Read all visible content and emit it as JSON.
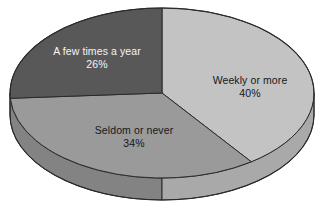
{
  "chart_data": {
    "type": "pie",
    "title": "",
    "subtitle": "",
    "xlabel": "",
    "ylabel": "",
    "legend_position": "none",
    "grid": false,
    "style": "3d-pie",
    "start_angle_deg": 0,
    "direction": "clockwise",
    "labels_inside": true,
    "background_color": "#ffffff",
    "categories": [
      "Weekly or more",
      "Seldom or never",
      "A few times a year"
    ],
    "values": [
      40,
      34,
      26
    ],
    "value_unit": "%",
    "slices": [
      {
        "label": "Weekly or more",
        "value": 40,
        "value_text": "40%",
        "color": "#c3c3c3",
        "side_color": "#a9a9a9",
        "text_color": "#16181a"
      },
      {
        "label": "Seldom or never",
        "value": 34,
        "value_text": "34%",
        "color": "#9a9a9a",
        "side_color": "#838383",
        "text_color": "#16181a"
      },
      {
        "label": "A few times a year",
        "value": 26,
        "value_text": "26%",
        "color": "#585858",
        "side_color": "#4a4a4a",
        "text_color": "#f4f5f6"
      }
    ]
  },
  "geometry": {
    "center_x": 162,
    "center_y": 93,
    "radius_x": 152,
    "radius_y": 85,
    "depth": 22,
    "outline_color": "#2a2a2a"
  }
}
